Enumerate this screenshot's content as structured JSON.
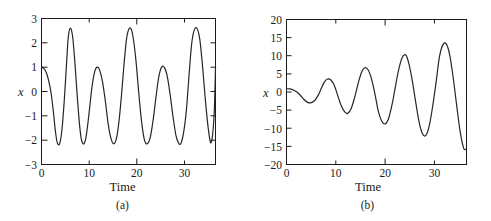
{
  "figure": {
    "background": "#ffffff",
    "line_color": "#262626",
    "axis_color": "#1a1a1a"
  },
  "panels": [
    {
      "caption": "(a)",
      "ylabel": "x",
      "xlabel": "Time"
    },
    {
      "caption": "(b)",
      "ylabel": "x",
      "xlabel": "Time"
    }
  ],
  "chart_data": [
    {
      "type": "line",
      "title": "",
      "subtitle": "",
      "xlabel": "Time",
      "ylabel": "x",
      "caption": "(a)",
      "xlim": [
        0,
        36.5
      ],
      "ylim": [
        -3,
        3
      ],
      "xticks": [
        0,
        10,
        20,
        30
      ],
      "xticklabels": [
        "0",
        "10",
        "20",
        "30"
      ],
      "yticks": [
        -3,
        -2,
        -1,
        0,
        1,
        2,
        3
      ],
      "yticklabels": [
        "-3",
        "-2",
        "-1",
        "0",
        "1",
        "2",
        "3"
      ],
      "minor_xticks": [
        5,
        15,
        25,
        35
      ],
      "grid": false,
      "legend": null,
      "series": [
        {
          "name": "beat response",
          "description": "Quasi-periodic beating oscillation; envelope peaks alternate between about 2.6 and 1.0, troughs stay near -2.15",
          "x": [
            0.0,
            0.5,
            1.0,
            1.5,
            2.0,
            2.5,
            2.9,
            3.3,
            3.8,
            4.3,
            4.8,
            5.3,
            5.6,
            6.0,
            6.5,
            7.0,
            7.5,
            8.0,
            8.4,
            8.9,
            9.4,
            10.0,
            10.6,
            11.2,
            11.7,
            12.2,
            12.8,
            13.4,
            14.0,
            14.6,
            15.2,
            15.8,
            16.3,
            16.8,
            17.3,
            17.8,
            18.2,
            18.7,
            19.2,
            19.8,
            20.4,
            21.0,
            21.6,
            22.2,
            22.8,
            23.4,
            24.0,
            24.6,
            25.2,
            25.8,
            26.4,
            27.0,
            27.6,
            28.2,
            28.7,
            29.2,
            29.8,
            30.4,
            31.0,
            31.5,
            32.0,
            32.6,
            33.2,
            33.8,
            34.4,
            35.0,
            35.6,
            36.2,
            36.5
          ],
          "y": [
            1.0,
            0.95,
            0.78,
            0.45,
            -0.05,
            -0.85,
            -1.6,
            -2.1,
            -2.15,
            -1.55,
            -0.3,
            1.3,
            2.2,
            2.6,
            2.3,
            1.2,
            -0.2,
            -1.4,
            -2.0,
            -2.15,
            -1.8,
            -0.85,
            0.2,
            0.85,
            1.0,
            0.88,
            0.4,
            -0.4,
            -1.35,
            -1.95,
            -2.15,
            -1.85,
            -1.15,
            -0.1,
            1.1,
            2.1,
            2.5,
            2.6,
            2.25,
            1.3,
            -0.05,
            -1.25,
            -2.0,
            -2.15,
            -1.9,
            -1.2,
            -0.25,
            0.6,
            1.0,
            0.98,
            0.6,
            -0.15,
            -1.05,
            -1.8,
            -2.1,
            -2.15,
            -1.7,
            -0.75,
            0.8,
            1.95,
            2.5,
            2.6,
            2.15,
            1.0,
            -0.4,
            -1.55,
            -2.1,
            -1.0,
            1.0
          ]
        }
      ]
    },
    {
      "type": "line",
      "title": "",
      "subtitle": "",
      "xlabel": "Time",
      "ylabel": "x",
      "caption": "(b)",
      "xlim": [
        0,
        36.5
      ],
      "ylim": [
        -20,
        20
      ],
      "xticks": [
        0,
        10,
        20,
        30
      ],
      "xticklabels": [
        "0",
        "10",
        "20",
        "30"
      ],
      "yticks": [
        -20,
        -15,
        -10,
        -5,
        0,
        5,
        10,
        15,
        20
      ],
      "yticklabels": [
        "-20",
        "-15",
        "-10",
        "-5",
        "0",
        "5",
        "10",
        "15",
        "20"
      ],
      "minor_xticks": [
        5,
        15,
        25,
        35
      ],
      "grid": false,
      "legend": null,
      "series": [
        {
          "name": "resonance response",
          "description": "Resonant oscillation with linearly growing amplitude, starting near 1 and reaching about +17 / -18 by t = 36",
          "x": [
            0.0,
            0.7,
            1.4,
            2.1,
            2.8,
            3.5,
            4.2,
            4.9,
            5.6,
            6.3,
            7.0,
            7.6,
            8.3,
            9.0,
            9.7,
            10.4,
            11.1,
            11.8,
            12.4,
            13.1,
            13.8,
            14.5,
            15.2,
            15.9,
            16.6,
            17.3,
            18.0,
            18.6,
            19.3,
            20.0,
            20.7,
            21.4,
            22.1,
            22.8,
            23.5,
            24.2,
            24.8,
            25.5,
            26.2,
            26.9,
            27.6,
            28.3,
            29.0,
            29.7,
            30.4,
            31.0,
            31.7,
            32.4,
            33.1,
            33.8,
            34.5,
            35.2,
            35.9,
            36.4
          ],
          "y": [
            0.9,
            0.85,
            0.55,
            0.0,
            -0.9,
            -2.0,
            -2.8,
            -3.0,
            -2.5,
            -1.2,
            0.8,
            2.6,
            3.6,
            3.3,
            1.8,
            -1.0,
            -3.8,
            -5.5,
            -5.9,
            -4.6,
            -1.6,
            2.2,
            5.4,
            6.7,
            6.0,
            3.3,
            -1.0,
            -5.2,
            -8.0,
            -8.8,
            -7.3,
            -3.5,
            1.6,
            6.5,
            9.6,
            10.2,
            7.9,
            3.2,
            -2.8,
            -8.4,
            -11.6,
            -11.9,
            -9.0,
            -3.4,
            3.4,
            9.6,
            13.0,
            13.3,
            10.2,
            4.0,
            -3.6,
            -10.8,
            -15.4,
            -15.8
          ]
        }
      ]
    }
  ]
}
